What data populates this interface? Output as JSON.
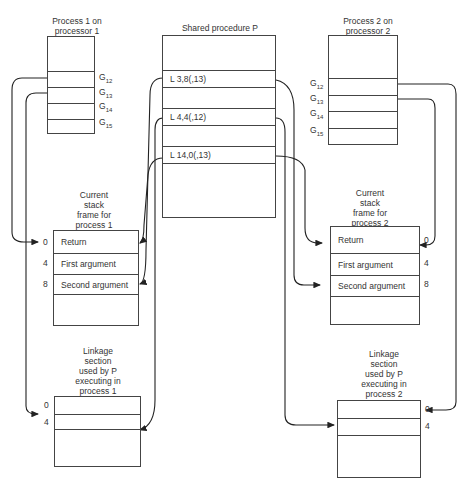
{
  "process1": {
    "title_line1": "Process 1 on",
    "title_line2": "processor 1",
    "slots": [
      {
        "base": "G",
        "sub": "12"
      },
      {
        "base": "G",
        "sub": "13"
      },
      {
        "base": "G",
        "sub": "14"
      },
      {
        "base": "G",
        "sub": "15"
      }
    ]
  },
  "shared": {
    "title": "Shared procedure P",
    "instructions": [
      "L  3,8(,13)",
      "L  4,4(,12)",
      "L  14,0(,13)"
    ]
  },
  "process2": {
    "title_line1": "Process 2 on",
    "title_line2": "processor 2",
    "slots": [
      {
        "base": "G",
        "sub": "12"
      },
      {
        "base": "G",
        "sub": "13"
      },
      {
        "base": "G",
        "sub": "14"
      },
      {
        "base": "G",
        "sub": "15"
      }
    ]
  },
  "stack1": {
    "title_lines": [
      "Current",
      "stack",
      "frame for",
      "process 1"
    ],
    "rows": [
      "Return",
      "First argument",
      "Second argument"
    ],
    "offsets": [
      "0",
      "4",
      "8"
    ]
  },
  "stack2": {
    "title_lines": [
      "Current",
      "stack",
      "frame for",
      "process 2"
    ],
    "rows": [
      "Return",
      "First argument",
      "Second argument"
    ],
    "offsets": [
      "0",
      "4",
      "8"
    ]
  },
  "linkage1": {
    "title_lines": [
      "Linkage",
      "section",
      "used by P",
      "executing in",
      "process 1"
    ],
    "offsets": [
      "0",
      "4"
    ]
  },
  "linkage2": {
    "title_lines": [
      "Linkage",
      "section",
      "used by P",
      "executing in",
      "process 2"
    ],
    "offsets": [
      "0",
      "4"
    ]
  }
}
